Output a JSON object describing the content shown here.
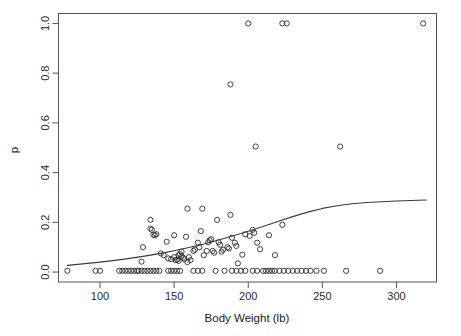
{
  "chart_data": {
    "type": "scatter",
    "title": "",
    "xlabel": "Body Weight (lb)",
    "ylabel": "p",
    "xlim": [
      72,
      327
    ],
    "ylim": [
      -0.04,
      1.04
    ],
    "xticks": [
      100,
      150,
      200,
      250,
      300
    ],
    "xtick_labels": [
      "100",
      "150",
      "200",
      "250",
      "300"
    ],
    "yticks": [
      0.0,
      0.2,
      0.4,
      0.6,
      0.8,
      1.0
    ],
    "ytick_labels": [
      "0.0",
      "0.2",
      "0.4",
      "0.6",
      "0.8",
      "1.0"
    ],
    "grid": false,
    "legend": null,
    "marker": "open-circle",
    "point_color": "#2e2e2e",
    "line_color": "#3a3a3a",
    "series": [
      {
        "name": "observations",
        "points": [
          [
            78,
            0.005
          ],
          [
            97,
            0.005
          ],
          [
            100,
            0.005
          ],
          [
            113,
            0.005
          ],
          [
            115,
            0.005
          ],
          [
            117,
            0.005
          ],
          [
            119,
            0.005
          ],
          [
            121,
            0.005
          ],
          [
            123,
            0.005
          ],
          [
            125,
            0.005
          ],
          [
            126,
            0.005
          ],
          [
            128,
            0.005
          ],
          [
            130,
            0.005
          ],
          [
            132,
            0.005
          ],
          [
            134,
            0.005
          ],
          [
            136,
            0.005
          ],
          [
            138,
            0.005
          ],
          [
            140,
            0.005
          ],
          [
            146,
            0.005
          ],
          [
            148,
            0.005
          ],
          [
            150,
            0.005
          ],
          [
            152,
            0.005
          ],
          [
            154,
            0.005
          ],
          [
            163,
            0.005
          ],
          [
            166,
            0.005
          ],
          [
            169,
            0.005
          ],
          [
            178,
            0.005
          ],
          [
            184,
            0.005
          ],
          [
            189,
            0.005
          ],
          [
            192,
            0.005
          ],
          [
            195,
            0.005
          ],
          [
            198,
            0.005
          ],
          [
            203,
            0.005
          ],
          [
            206,
            0.005
          ],
          [
            210,
            0.005
          ],
          [
            212,
            0.005
          ],
          [
            214,
            0.005
          ],
          [
            216,
            0.005
          ],
          [
            218,
            0.005
          ],
          [
            221,
            0.005
          ],
          [
            224,
            0.005
          ],
          [
            227,
            0.005
          ],
          [
            230,
            0.005
          ],
          [
            233,
            0.005
          ],
          [
            236,
            0.005
          ],
          [
            239,
            0.005
          ],
          [
            242,
            0.005
          ],
          [
            246,
            0.005
          ],
          [
            251,
            0.005
          ],
          [
            266,
            0.005
          ],
          [
            289,
            0.005
          ],
          [
            128,
            0.042
          ],
          [
            129,
            0.1
          ],
          [
            134,
            0.21
          ],
          [
            134,
            0.175
          ],
          [
            135,
            0.17
          ],
          [
            136,
            0.15
          ],
          [
            137,
            0.148
          ],
          [
            138,
            0.152
          ],
          [
            141,
            0.075
          ],
          [
            143,
            0.068
          ],
          [
            145,
            0.122
          ],
          [
            146,
            0.055
          ],
          [
            148,
            0.052
          ],
          [
            150,
            0.148
          ],
          [
            150,
            0.06
          ],
          [
            151,
            0.048
          ],
          [
            152,
            0.05
          ],
          [
            153,
            0.045
          ],
          [
            153,
            0.068
          ],
          [
            154,
            0.072
          ],
          [
            155,
            0.082
          ],
          [
            155,
            0.064
          ],
          [
            156,
            0.058
          ],
          [
            157,
            0.052
          ],
          [
            158,
            0.142
          ],
          [
            159,
            0.255
          ],
          [
            159,
            0.04
          ],
          [
            160,
            0.06
          ],
          [
            161,
            0.048
          ],
          [
            163,
            0.085
          ],
          [
            164,
            0.09
          ],
          [
            166,
            0.118
          ],
          [
            167,
            0.1
          ],
          [
            168,
            0.165
          ],
          [
            169,
            0.255
          ],
          [
            170,
            0.068
          ],
          [
            172,
            0.085
          ],
          [
            173,
            0.12
          ],
          [
            174,
            0.128
          ],
          [
            175,
            0.132
          ],
          [
            176,
            0.085
          ],
          [
            177,
            0.078
          ],
          [
            179,
            0.21
          ],
          [
            180,
            0.12
          ],
          [
            181,
            0.11
          ],
          [
            182,
            0.082
          ],
          [
            183,
            0.09
          ],
          [
            186,
            0.1
          ],
          [
            187,
            0.095
          ],
          [
            188,
            0.23
          ],
          [
            189,
            0.138
          ],
          [
            191,
            0.118
          ],
          [
            192,
            0.105
          ],
          [
            193,
            0.035
          ],
          [
            196,
            0.07
          ],
          [
            198,
            0.152
          ],
          [
            201,
            0.145
          ],
          [
            203,
            0.17
          ],
          [
            204,
            0.158
          ],
          [
            206,
            0.118
          ],
          [
            208,
            0.092
          ],
          [
            214,
            0.148
          ],
          [
            218,
            0.068
          ],
          [
            223,
            0.19
          ],
          [
            200,
            1.0
          ],
          [
            223,
            1.0
          ],
          [
            226,
            1.0
          ],
          [
            318,
            1.0
          ],
          [
            188,
            0.755
          ],
          [
            205,
            0.505
          ],
          [
            262,
            0.505
          ]
        ]
      }
    ],
    "fit_curve": {
      "name": "logistic fit",
      "points": [
        [
          78,
          0.027
        ],
        [
          90,
          0.034
        ],
        [
          100,
          0.04
        ],
        [
          110,
          0.047
        ],
        [
          120,
          0.055
        ],
        [
          130,
          0.064
        ],
        [
          140,
          0.074
        ],
        [
          150,
          0.086
        ],
        [
          160,
          0.099
        ],
        [
          170,
          0.113
        ],
        [
          180,
          0.129
        ],
        [
          190,
          0.146
        ],
        [
          200,
          0.164
        ],
        [
          210,
          0.183
        ],
        [
          220,
          0.203
        ],
        [
          230,
          0.223
        ],
        [
          240,
          0.241
        ],
        [
          250,
          0.256
        ],
        [
          260,
          0.267
        ],
        [
          270,
          0.275
        ],
        [
          280,
          0.28
        ],
        [
          290,
          0.283
        ],
        [
          300,
          0.286
        ],
        [
          310,
          0.288
        ],
        [
          320,
          0.29
        ]
      ]
    }
  },
  "axes": {
    "x_title": "Body Weight (lb)",
    "y_title": "p"
  }
}
